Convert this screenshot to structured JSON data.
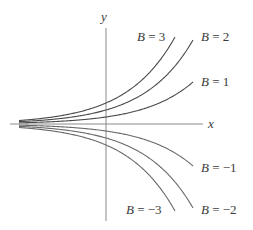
{
  "chart_data": {
    "type": "line",
    "title": "",
    "xlabel": "x",
    "ylabel": "y",
    "function": "y = B e^x",
    "grid": false,
    "legend_position": "inline curve labels",
    "axis_color": "#8a8a8a",
    "curve_color": "#5a5a5a",
    "series": [
      {
        "name": "B = 3",
        "B": 3,
        "label_var": "B",
        "label_eq": " = 3"
      },
      {
        "name": "B = 2",
        "B": 2,
        "label_var": "B",
        "label_eq": " = 2"
      },
      {
        "name": "B = 1",
        "B": 1,
        "label_var": "B",
        "label_eq": " = 1"
      },
      {
        "name": "B = -1",
        "B": -1,
        "label_var": "B",
        "label_eq": " = −1"
      },
      {
        "name": "B = -2",
        "B": -2,
        "label_var": "B",
        "label_eq": " = −2"
      },
      {
        "name": "B = -3",
        "B": -3,
        "label_var": "B",
        "label_eq": " = −3"
      }
    ]
  },
  "labels": {
    "x_axis": "x",
    "y_axis": "y"
  }
}
